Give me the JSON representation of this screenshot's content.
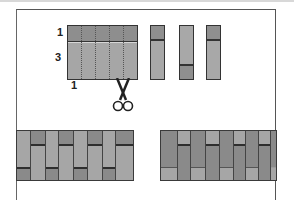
{
  "diagram": {
    "labels": {
      "top_band": "1",
      "main_band": "3",
      "strip_width": "1"
    },
    "icons": [
      "scissors-icon"
    ],
    "colors": {
      "dark_fabric": "#8e8e8e",
      "light_fabric": "#a6a6a6",
      "outline": "#333333",
      "background": "#ffffff"
    },
    "pieces": {
      "cut_strips": [
        {
          "orientation": "dark-top"
        },
        {
          "orientation": "dark-bottom"
        },
        {
          "orientation": "dark-top"
        }
      ]
    },
    "results": [
      {
        "name": "left-arrangement",
        "columns": 8
      },
      {
        "name": "right-arrangement",
        "columns": 8
      }
    ]
  }
}
